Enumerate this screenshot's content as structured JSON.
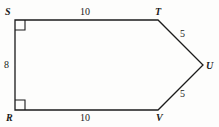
{
  "figure": {
    "type": "polygon-diagram",
    "stroke_color": "#1b1b1b",
    "background_color": "#fdfdfc",
    "stroke_width": 1.3,
    "vertices": [
      {
        "name": "S",
        "label": "S",
        "x": 15,
        "y": 20,
        "right_angle": true
      },
      {
        "name": "T",
        "label": "T",
        "x": 158,
        "y": 20,
        "right_angle": false
      },
      {
        "name": "U",
        "label": "U",
        "x": 203,
        "y": 65,
        "right_angle": false
      },
      {
        "name": "V",
        "label": "V",
        "x": 158,
        "y": 110,
        "right_angle": false
      },
      {
        "name": "R",
        "label": "R",
        "x": 15,
        "y": 110,
        "right_angle": true
      }
    ],
    "sides": [
      {
        "from": "S",
        "to": "T",
        "length_label": "10"
      },
      {
        "from": "T",
        "to": "U",
        "length_label": "5"
      },
      {
        "from": "U",
        "to": "V",
        "length_label": "5"
      },
      {
        "from": "V",
        "to": "R",
        "length_label": "10"
      },
      {
        "from": "R",
        "to": "S",
        "length_label": "8"
      }
    ],
    "right_angle_marker_size": 10
  }
}
